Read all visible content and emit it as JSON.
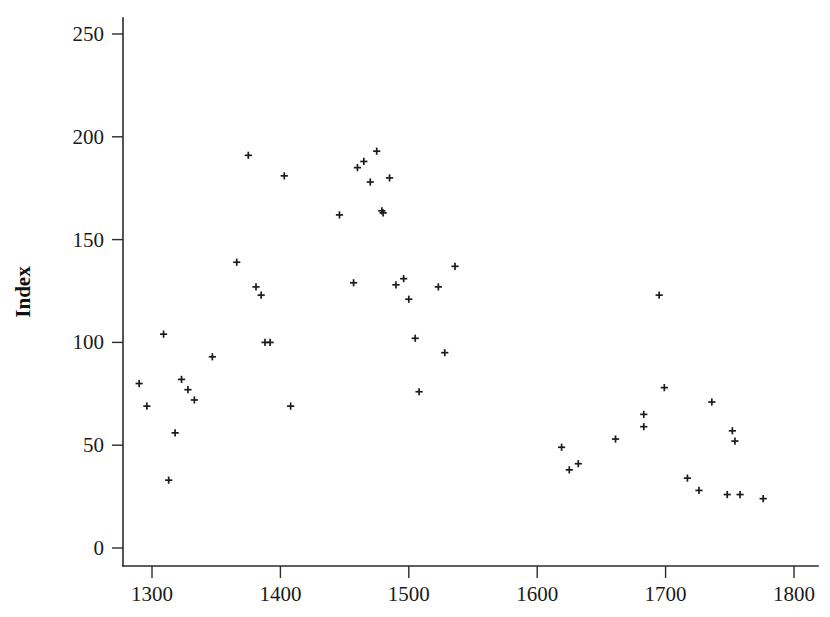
{
  "chart_data": {
    "type": "scatter",
    "title": "",
    "subtitle": "",
    "xlabel": "",
    "ylabel": "Index",
    "xlim": [
      1278,
      1808
    ],
    "ylim": [
      0,
      260
    ],
    "xticks": [
      1300,
      1400,
      1500,
      1600,
      1700,
      1800
    ],
    "yticks": [
      0,
      50,
      100,
      150,
      200,
      250
    ],
    "grid": false,
    "legend": null,
    "marker": "plus",
    "marker_color": "#1b1b1b",
    "series": [
      {
        "name": "Index",
        "points": [
          [
            1290,
            80
          ],
          [
            1296,
            69
          ],
          [
            1309,
            104
          ],
          [
            1313,
            33
          ],
          [
            1318,
            56
          ],
          [
            1323,
            82
          ],
          [
            1328,
            77
          ],
          [
            1333,
            72
          ],
          [
            1347,
            93
          ],
          [
            1366,
            139
          ],
          [
            1375,
            191
          ],
          [
            1381,
            127
          ],
          [
            1385,
            123
          ],
          [
            1388,
            100
          ],
          [
            1392,
            100
          ],
          [
            1403,
            181
          ],
          [
            1408,
            69
          ],
          [
            1446,
            162
          ],
          [
            1457,
            129
          ],
          [
            1460,
            185
          ],
          [
            1465,
            188
          ],
          [
            1470,
            178
          ],
          [
            1475,
            193
          ],
          [
            1479,
            164
          ],
          [
            1480,
            163
          ],
          [
            1485,
            180
          ],
          [
            1490,
            128
          ],
          [
            1496,
            131
          ],
          [
            1500,
            121
          ],
          [
            1505,
            102
          ],
          [
            1508,
            76
          ],
          [
            1523,
            127
          ],
          [
            1528,
            95
          ],
          [
            1536,
            137
          ],
          [
            1619,
            49
          ],
          [
            1625,
            38
          ],
          [
            1632,
            41
          ],
          [
            1661,
            53
          ],
          [
            1683,
            59
          ],
          [
            1683,
            65
          ],
          [
            1695,
            123
          ],
          [
            1699,
            78
          ],
          [
            1717,
            34
          ],
          [
            1726,
            28
          ],
          [
            1736,
            71
          ],
          [
            1748,
            26
          ],
          [
            1752,
            57
          ],
          [
            1754,
            52
          ],
          [
            1758,
            26
          ],
          [
            1776,
            24
          ]
        ]
      }
    ]
  },
  "figure": {
    "background_color": "#ffffff",
    "axis_color": "#2b2b2b"
  }
}
